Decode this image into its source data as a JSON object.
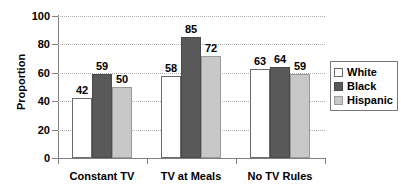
{
  "chart_data": {
    "type": "bar",
    "title": "",
    "xlabel": "",
    "ylabel": "Proportion",
    "ylim": [
      0,
      100
    ],
    "yticks": [
      0,
      20,
      40,
      60,
      80,
      100
    ],
    "grid": true,
    "legend_position": "right",
    "categories": [
      "Constant TV",
      "TV at Meals",
      "No TV Rules"
    ],
    "series": [
      {
        "name": "White",
        "color": "#ffffff",
        "values": [
          42,
          58,
          63
        ]
      },
      {
        "name": "Black",
        "color": "#595959",
        "values": [
          59,
          85,
          64
        ]
      },
      {
        "name": "Hispanic",
        "color": "#c8c8c8",
        "values": [
          50,
          72,
          59
        ]
      }
    ]
  },
  "axis": {
    "y_title": "Proportion",
    "y_tick_labels": [
      "100",
      "80",
      "60",
      "40",
      "20",
      "0"
    ],
    "x_tick_labels": [
      "Constant TV",
      "TV at Meals",
      "No TV Rules"
    ]
  },
  "legend": {
    "items": [
      {
        "label": "White",
        "swatch": "white-swatch"
      },
      {
        "label": "Black",
        "swatch": "black-swatch"
      },
      {
        "label": "Hispanic",
        "swatch": "hispanic-swatch"
      }
    ]
  },
  "values": {
    "constant_tv": {
      "white": "42",
      "black": "59",
      "hispanic": "50"
    },
    "tv_at_meals": {
      "white": "58",
      "black": "85",
      "hispanic": "72"
    },
    "no_tv_rules": {
      "white": "63",
      "black": "64",
      "hispanic": "59"
    }
  }
}
